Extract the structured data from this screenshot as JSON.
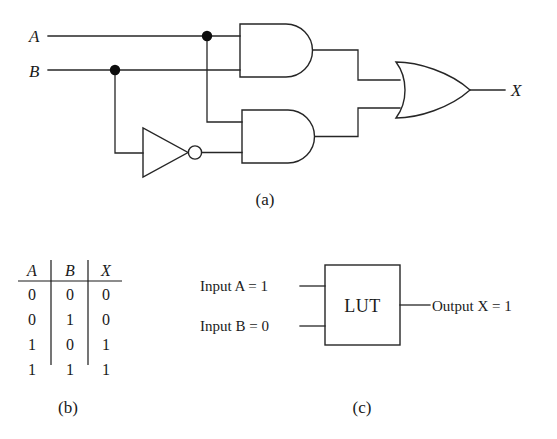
{
  "figure": {
    "caption_a": "(a)",
    "caption_b": "(b)",
    "caption_c": "(c)"
  },
  "circuit": {
    "input_a_label": "A",
    "input_b_label": "B",
    "output_label": "X",
    "gates": [
      {
        "name": "and-gate-top",
        "type": "AND"
      },
      {
        "name": "and-gate-bottom",
        "type": "AND"
      },
      {
        "name": "not-gate",
        "type": "NOT"
      },
      {
        "name": "or-gate",
        "type": "OR"
      }
    ]
  },
  "truth_table": {
    "headers": [
      "A",
      "B",
      "X"
    ],
    "rows": [
      [
        "0",
        "0",
        "0"
      ],
      [
        "0",
        "1",
        "0"
      ],
      [
        "1",
        "0",
        "1"
      ],
      [
        "1",
        "1",
        "1"
      ]
    ]
  },
  "lut": {
    "box_label": "LUT",
    "input_a": "Input A = 1",
    "input_b": "Input B = 0",
    "output": "Output X = 1"
  },
  "colors": {
    "ink": "#262626",
    "background": "#ffffff"
  }
}
